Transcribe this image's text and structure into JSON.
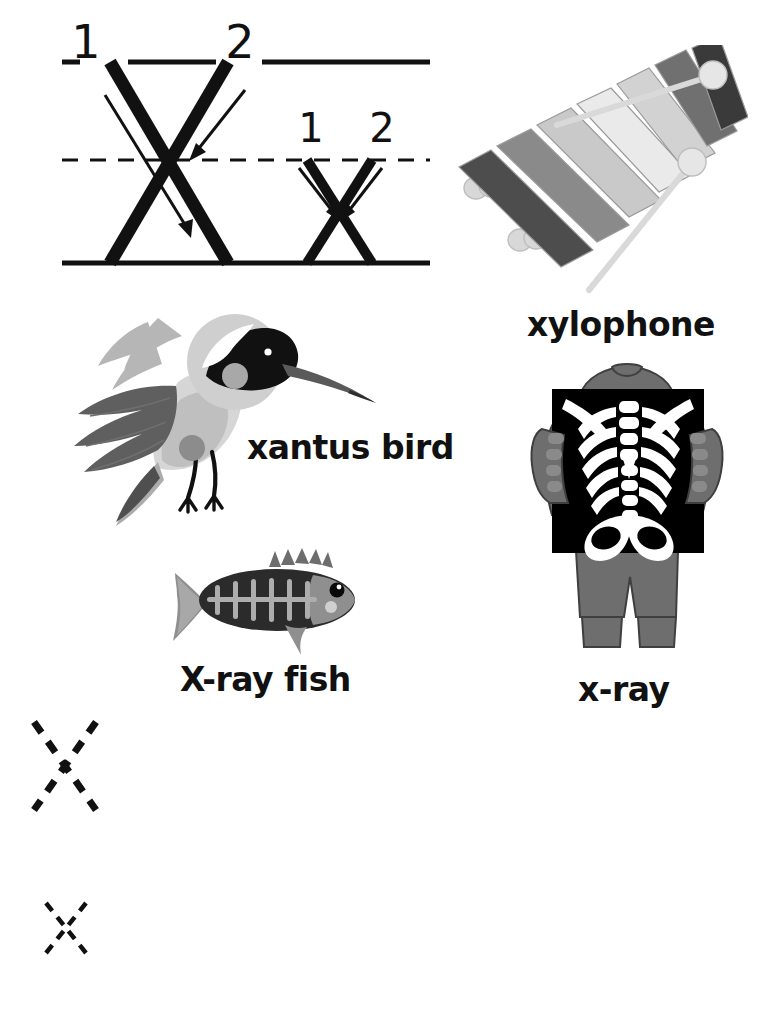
{
  "worksheet": {
    "letter": "X",
    "background_color": "#ffffff",
    "ink_color": "#111111"
  },
  "stroke_guide": {
    "name": "letter-x-stroke-order-guide",
    "uppercase": {
      "letter": "X",
      "stroke_numbers": [
        "1",
        "2"
      ],
      "stroke_count": 2
    },
    "lowercase": {
      "letter": "x",
      "stroke_numbers": [
        "1",
        "2"
      ],
      "stroke_count": 2
    },
    "rule_lines": {
      "top_line": "solid",
      "middle_line": "dashed",
      "baseline": "solid"
    }
  },
  "pictures": [
    {
      "id": "xylophone",
      "label": "xylophone",
      "art": "xylophone-illustration",
      "bar_count": 7,
      "mallet_count": 2,
      "bar_colors": [
        "#4d4d4d",
        "#8c8c8c",
        "#c8c8c8",
        "#e8e8e8",
        "#d2d2d2",
        "#707070",
        "#3a3a3a"
      ]
    },
    {
      "id": "xantus-bird",
      "label": "xantus bird",
      "art": "xantus-hummingbird-illustration",
      "colors": [
        "#b0b0b0",
        "#6b6b6b",
        "#d8d8d8",
        "#111111",
        "#ffffff"
      ]
    },
    {
      "id": "x-ray-fish",
      "label": "X-ray fish",
      "art": "x-ray-fish-illustration",
      "rib_count": 6,
      "colors": [
        "#2b2b2b",
        "#8f8f8f",
        "#adadad"
      ]
    },
    {
      "id": "x-ray",
      "label": "x-ray",
      "art": "child-holding-x-ray-film-illustration",
      "rib_pairs": 6,
      "colors": [
        "#6e6e6e",
        "#000000",
        "#ffffff"
      ]
    }
  ],
  "practice_rows": [
    {
      "id": "row-1",
      "trace_letter": "X",
      "case": "uppercase",
      "trace_style": "dashed",
      "extent": "top-line-to-baseline",
      "top_line": "solid",
      "middle_line": "dashed",
      "baseline": "solid"
    },
    {
      "id": "row-2",
      "trace_letter": "x",
      "case": "lowercase",
      "trace_style": "dashed",
      "extent": "middle-line-to-baseline",
      "top_line": "solid",
      "middle_line": "dashed",
      "baseline": "solid"
    }
  ]
}
